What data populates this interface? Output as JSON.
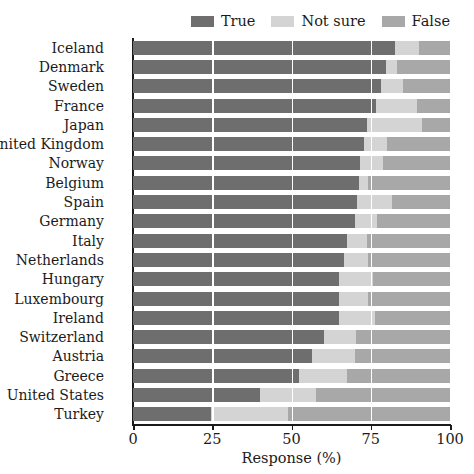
{
  "legend": {
    "position": "top-right",
    "entries": [
      {
        "label": "True",
        "color": "#6e6e6e",
        "icon": "swatch-icon"
      },
      {
        "label": "Not sure",
        "color": "#d4d4d4",
        "icon": "swatch-icon"
      },
      {
        "label": "False",
        "color": "#a8a8a8",
        "icon": "swatch-icon"
      }
    ]
  },
  "axis": {
    "xlabel": "Response (%)",
    "ylabel": "",
    "xticks": [
      0,
      25,
      50,
      75,
      100
    ],
    "xtick_labels": [
      "0",
      "25",
      "50",
      "75",
      "100"
    ],
    "xlim": [
      0,
      100
    ],
    "grid": true,
    "gridline_color": "#ffffff"
  },
  "colors": {
    "true": "#6e6e6e",
    "not_sure": "#d4d4d4",
    "false": "#a8a8a8",
    "axis": "#1b1b1b",
    "background": "#ffffff",
    "text": "#1b1b1b"
  },
  "chart_data": {
    "type": "bar",
    "orientation": "horizontal",
    "stacked": true,
    "normalized": true,
    "title": "",
    "xlabel": "Response (%)",
    "ylabel": "",
    "xlim": [
      0,
      100
    ],
    "grid": true,
    "legend_position": "top-right",
    "categories": [
      "Iceland",
      "Denmark",
      "Sweden",
      "France",
      "Japan",
      "United Kingdom",
      "Norway",
      "Belgium",
      "Spain",
      "Germany",
      "Italy",
      "Netherlands",
      "Hungary",
      "Luxembourg",
      "Ireland",
      "Switzerland",
      "Austria",
      "Greece",
      "United States",
      "Turkey"
    ],
    "series": [
      {
        "name": "True",
        "color": "#6e6e6e",
        "values": [
          82.6,
          79.8,
          78.2,
          76.7,
          73.8,
          72.9,
          71.6,
          71.3,
          70.6,
          70.0,
          67.5,
          66.6,
          65.0,
          65.0,
          65.0,
          60.2,
          56.4,
          52.4,
          40.0,
          24.5
        ]
      },
      {
        "name": "Not sure",
        "color": "#d4d4d4",
        "values": [
          7.6,
          3.4,
          7.1,
          12.9,
          17.3,
          7.2,
          7.2,
          2.8,
          11.1,
          7.0,
          6.3,
          7.5,
          10.7,
          9.1,
          11.3,
          10.3,
          13.6,
          15.0,
          17.8,
          24.3
        ]
      },
      {
        "name": "False",
        "color": "#a8a8a8",
        "values": [
          9.8,
          16.8,
          14.7,
          10.4,
          8.9,
          19.9,
          21.2,
          25.9,
          18.3,
          23.0,
          26.2,
          25.9,
          24.3,
          25.9,
          23.7,
          29.5,
          30.0,
          32.6,
          42.2,
          51.2
        ]
      }
    ]
  }
}
